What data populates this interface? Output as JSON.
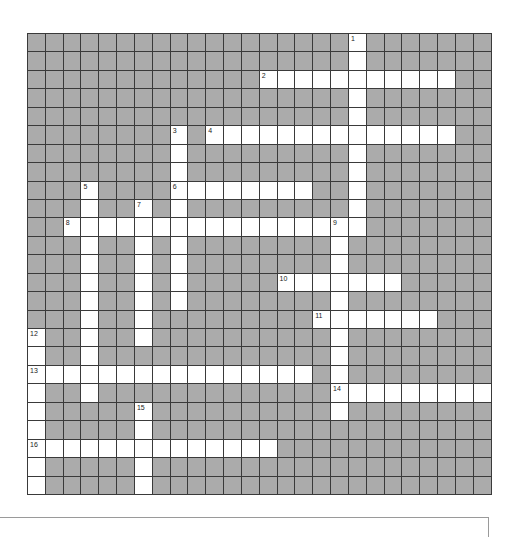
{
  "puzzle": {
    "rows": 25,
    "cols": 26,
    "colors": {
      "blocked": "#ababab",
      "open": "#ffffff",
      "grid_line": "#3a3a3a"
    },
    "entries": [
      {
        "number": "1",
        "direction": "down",
        "row": 0,
        "col": 18,
        "length": 11
      },
      {
        "number": "2",
        "direction": "across",
        "row": 2,
        "col": 13,
        "length": 11
      },
      {
        "number": "3",
        "direction": "down",
        "row": 5,
        "col": 8,
        "length": 10
      },
      {
        "number": "4",
        "direction": "across",
        "row": 5,
        "col": 10,
        "length": 14
      },
      {
        "number": "5",
        "direction": "down",
        "row": 8,
        "col": 3,
        "length": 12
      },
      {
        "number": "6",
        "direction": "across",
        "row": 8,
        "col": 8,
        "length": 8
      },
      {
        "number": "7",
        "direction": "down",
        "row": 9,
        "col": 6,
        "length": 8
      },
      {
        "number": "8",
        "direction": "across",
        "row": 10,
        "col": 2,
        "length": 17
      },
      {
        "number": "9",
        "direction": "down",
        "row": 10,
        "col": 17,
        "length": 11
      },
      {
        "number": "10",
        "direction": "across",
        "row": 13,
        "col": 14,
        "length": 7
      },
      {
        "number": "11",
        "direction": "across",
        "row": 15,
        "col": 16,
        "length": 7
      },
      {
        "number": "12",
        "direction": "down",
        "row": 16,
        "col": 0,
        "length": 9
      },
      {
        "number": "13",
        "direction": "across",
        "row": 18,
        "col": 0,
        "length": 16
      },
      {
        "number": "14",
        "direction": "across",
        "row": 19,
        "col": 17,
        "length": 9
      },
      {
        "number": "15",
        "direction": "down",
        "row": 20,
        "col": 6,
        "length": 5
      },
      {
        "number": "16",
        "direction": "across",
        "row": 22,
        "col": 0,
        "length": 14
      }
    ]
  }
}
